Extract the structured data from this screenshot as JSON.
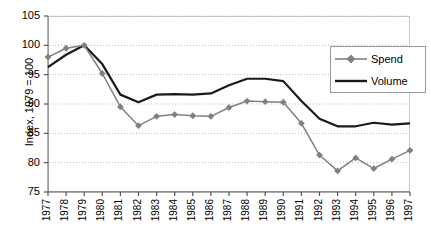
{
  "chart_data": {
    "type": "line",
    "title": "",
    "xlabel": "",
    "ylabel": "Index, 1979 = 100",
    "ylim": [
      75,
      105
    ],
    "ytick_values": [
      75,
      80,
      85,
      90,
      95,
      100,
      105
    ],
    "ytick_labels": [
      "75",
      "80",
      "85",
      "90",
      "95",
      "100",
      "105"
    ],
    "grid": true,
    "grid_style": "dotted-horizontal",
    "legend_position": "upper-right-inside",
    "x": [
      1977,
      1978,
      1979,
      1980,
      1981,
      1982,
      1983,
      1984,
      1985,
      1986,
      1987,
      1988,
      1989,
      1990,
      1991,
      1992,
      1993,
      1994,
      1995,
      1996,
      1997
    ],
    "categories": [
      "1977",
      "1978",
      "1979",
      "1980",
      "1981",
      "1982",
      "1983",
      "1984",
      "1985",
      "1986",
      "1987",
      "1988",
      "1989",
      "1990",
      "1991",
      "1992",
      "1993",
      "1994",
      "1995",
      "1996",
      "1997"
    ],
    "series": [
      {
        "name": "Spend",
        "color": "#808080",
        "marker": "diamond",
        "values": [
          98.0,
          99.5,
          100.0,
          95.2,
          89.5,
          86.3,
          87.9,
          88.2,
          88.0,
          87.9,
          89.4,
          90.5,
          90.4,
          90.3,
          86.7,
          81.3,
          78.6,
          80.8,
          79.0,
          80.6,
          82.1
        ]
      },
      {
        "name": "Volume",
        "color": "#1a1a1a",
        "marker": "none",
        "values": [
          96.3,
          98.4,
          100.0,
          96.8,
          91.6,
          90.3,
          91.6,
          91.7,
          91.6,
          91.8,
          93.2,
          94.3,
          94.3,
          93.9,
          90.5,
          87.5,
          86.2,
          86.2,
          86.8,
          86.5,
          86.7
        ]
      }
    ]
  },
  "legend": {
    "items": [
      {
        "label": "Spend"
      },
      {
        "label": "Volume"
      }
    ]
  },
  "axis": {
    "y_title": "Index, 1979 = 100"
  }
}
